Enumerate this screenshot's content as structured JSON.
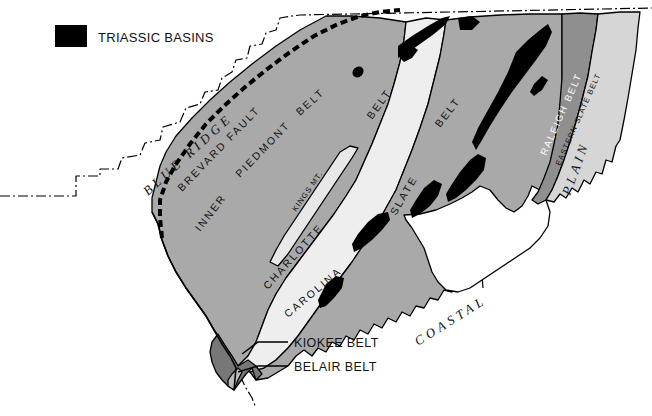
{
  "legend": {
    "swatch_color": "#000000",
    "label": "TRIASSIC BASINS"
  },
  "colors": {
    "triassic_basin": "#000000",
    "inner_piedmont": "#a9a9a9",
    "kings_mountain": "#e8e8e8",
    "charlotte": "#eeeeee",
    "carolina_slate": "#a9a9a9",
    "raleigh": "#8f8f8f",
    "eastern_slate": "#d6d6d6",
    "kiokee": "#777777",
    "belair": "#bdbdbd",
    "coastal_plain": "#ffffff",
    "blue_ridge": "#ffffff",
    "outline": "#000000",
    "state_boundary": "#000000",
    "brevard_fault": "#000000"
  },
  "map": {
    "regions": [
      {
        "name": "blue-ridge",
        "label": "BLUE RIDGE",
        "style": "italic-serif"
      },
      {
        "name": "coastal-plain",
        "label": "COASTAL PLAIN",
        "style": "italic-serif"
      }
    ],
    "faults": [
      {
        "name": "brevard-fault",
        "label": "BREVARD FAULT",
        "style": "heavy-dashed"
      }
    ],
    "belts": [
      {
        "name": "inner-piedmont-belt",
        "label": "INNER PIEDMONT BELT",
        "fill": "#a9a9a9"
      },
      {
        "name": "kings-mountain-belt",
        "label": "KINGS MT.",
        "fill": "#e8e8e8"
      },
      {
        "name": "charlotte-belt",
        "label": "CHARLOTTE BELT",
        "fill": "#eeeeee"
      },
      {
        "name": "carolina-slate-belt",
        "label": "CAROLINA SLATE BELT",
        "fill": "#a9a9a9"
      },
      {
        "name": "raleigh-belt",
        "label": "RALEIGH BELT",
        "fill": "#8f8f8f"
      },
      {
        "name": "eastern-slate-belt",
        "label": "EASTERN SLATE BELT",
        "fill": "#d6d6d6"
      },
      {
        "name": "kiokee-belt",
        "label": "KIOKEE BELT",
        "fill": "#777777"
      },
      {
        "name": "belair-belt",
        "label": "BELAIR BELT",
        "fill": "#bdbdbd"
      }
    ],
    "labels": {
      "blue_ridge_1": "B",
      "blue_ridge_2": "L",
      "blue_ridge_3": "U",
      "blue_ridge_4": "E",
      "blue_ridge_5": "R",
      "blue_ridge_6": "I",
      "blue_ridge_7": "D",
      "blue_ridge_8": "G",
      "blue_ridge_9": "E",
      "blue_ridge_full": "BLUE RIDGE",
      "brevard_fault": "BREVARD FAULT",
      "inner": "INNER",
      "piedmont": "PIEDMONT",
      "belt_inner": "BELT",
      "kings_mt": "KINGS MT.",
      "charlotte": "CHARLOTTE",
      "belt_charlotte": "BELT",
      "carolina": "CAROLINA",
      "slate": "SLATE",
      "belt_slate": "BELT",
      "raleigh_belt": "RALEIGH BELT",
      "eastern_slate_belt": "EASTERN SLATE BELT",
      "coastal": "COASTAL",
      "plain": "PLAIN",
      "kiokee_belt": "KIOKEE  BELT",
      "belair_belt": "BELAIR BELT"
    }
  }
}
